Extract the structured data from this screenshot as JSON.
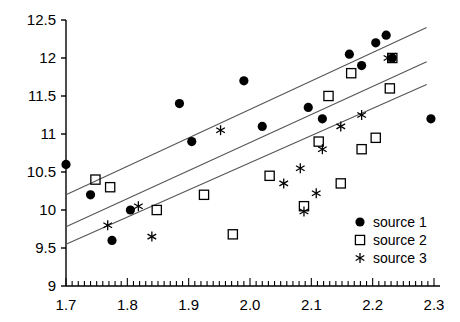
{
  "chart_data": {
    "type": "scatter",
    "title": "",
    "xlabel": "",
    "ylabel": "",
    "xlim": [
      1.7,
      2.3
    ],
    "ylim": [
      9,
      12.5
    ],
    "xticks": [
      1.7,
      1.8,
      1.9,
      2.0,
      2.1,
      2.2,
      2.3
    ],
    "xtick_labels": [
      "1.7",
      "1.8",
      "1.9",
      "2.0",
      "2.1",
      "2.2",
      "2.3"
    ],
    "yticks": [
      9,
      9.5,
      10,
      10.5,
      11,
      11.5,
      12,
      12.5
    ],
    "ytick_labels": [
      "9",
      "9.5",
      "10",
      "10.5",
      "11",
      "11.5",
      "12",
      "12.5"
    ],
    "grid": false,
    "minor_ticks_x": true,
    "legend_position": "lower right",
    "series": [
      {
        "name": "source 1",
        "marker": "filled-circle",
        "color": "#000000",
        "points": [
          [
            1.7,
            10.6
          ],
          [
            1.74,
            10.2
          ],
          [
            1.775,
            9.6
          ],
          [
            1.805,
            10.0
          ],
          [
            1.885,
            11.4
          ],
          [
            1.905,
            10.9
          ],
          [
            1.99,
            11.7
          ],
          [
            2.02,
            11.1
          ],
          [
            2.095,
            11.35
          ],
          [
            2.118,
            11.2
          ],
          [
            2.162,
            12.05
          ],
          [
            2.182,
            11.9
          ],
          [
            2.205,
            12.2
          ],
          [
            2.222,
            12.3
          ],
          [
            2.232,
            12.0
          ],
          [
            2.295,
            11.2
          ]
        ]
      },
      {
        "name": "source 2",
        "marker": "open-square",
        "color": "#000000",
        "points": [
          [
            1.748,
            10.4
          ],
          [
            1.772,
            10.3
          ],
          [
            1.848,
            10.0
          ],
          [
            1.925,
            10.2
          ],
          [
            1.972,
            9.68
          ],
          [
            2.032,
            10.45
          ],
          [
            2.088,
            10.05
          ],
          [
            2.112,
            10.9
          ],
          [
            2.128,
            11.5
          ],
          [
            2.148,
            10.35
          ],
          [
            2.165,
            11.8
          ],
          [
            2.182,
            10.8
          ],
          [
            2.205,
            10.95
          ],
          [
            2.228,
            11.6
          ],
          [
            2.232,
            12.0
          ]
        ]
      },
      {
        "name": "source 3",
        "marker": "asterisk",
        "color": "#000000",
        "points": [
          [
            1.768,
            9.8
          ],
          [
            1.818,
            10.05
          ],
          [
            1.84,
            9.65
          ],
          [
            1.952,
            11.05
          ],
          [
            2.055,
            10.35
          ],
          [
            2.082,
            10.55
          ],
          [
            2.088,
            9.98
          ],
          [
            2.108,
            10.22
          ],
          [
            2.118,
            10.8
          ],
          [
            2.148,
            11.1
          ],
          [
            2.182,
            11.25
          ],
          [
            2.225,
            12.0
          ]
        ]
      }
    ],
    "trend_lines": [
      {
        "name": "trend-upper",
        "x0": 1.7,
        "y0": 10.2,
        "x1": 2.288,
        "y1": 12.4
      },
      {
        "name": "trend-middle",
        "x0": 1.7,
        "y0": 9.78,
        "x1": 2.288,
        "y1": 11.95
      },
      {
        "name": "trend-lower",
        "x0": 1.7,
        "y0": 9.55,
        "x1": 2.288,
        "y1": 11.65
      }
    ]
  },
  "legend": {
    "items": [
      {
        "label": "source 1",
        "marker": "filled-circle"
      },
      {
        "label": "source 2",
        "marker": "open-square"
      },
      {
        "label": "source 3",
        "marker": "asterisk"
      }
    ]
  }
}
